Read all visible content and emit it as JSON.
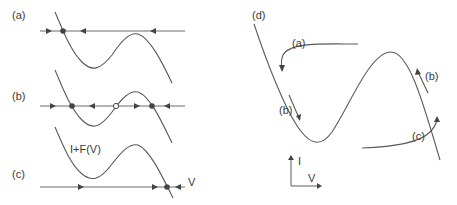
{
  "figure": {
    "panels": {
      "a": {
        "label": "(a)"
      },
      "b": {
        "label": "(b)"
      },
      "c": {
        "label": "(c)",
        "curve_label": "I+F(V)",
        "axis_label": "V"
      },
      "d": {
        "label": "(d)",
        "trajectory_labels": {
          "a": "(a)",
          "b_left": "(b)",
          "b_right": "(b)",
          "c": "(c)"
        },
        "axes": {
          "x": "V",
          "y": "I"
        }
      }
    },
    "colors": {
      "stroke": "#5a5a5a",
      "text": "#3a3a3a",
      "background": "#ffffff"
    }
  }
}
